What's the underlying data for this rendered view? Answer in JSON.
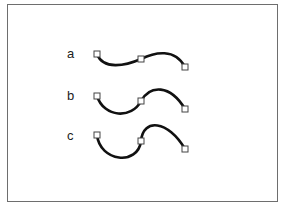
{
  "diagram": {
    "curves": [
      {
        "label": "a",
        "description": "gentle S-curve, short handles"
      },
      {
        "label": "b",
        "description": "moderate S-curve, medium handles"
      },
      {
        "label": "c",
        "description": "pronounced S-curve, long handles"
      }
    ],
    "anchor_points_per_curve": 3,
    "stroke_color": "#111111",
    "anchor_fill": "#ffffff",
    "anchor_stroke": "#444444",
    "frame_color": "#6e6e6e"
  },
  "caption": ""
}
